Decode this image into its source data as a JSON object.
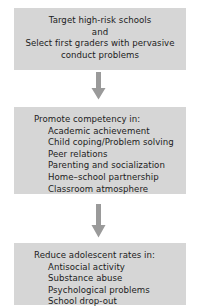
{
  "diagram": {
    "type": "flowchart",
    "orientation": "vertical",
    "colors": {
      "box_fill": "#d6d6d6",
      "text": "#1c1c1c",
      "arrow": "#9a9a9a",
      "background": "#ffffff"
    },
    "nodes": [
      {
        "id": "node-target",
        "align": "center",
        "lines": [
          "Target high-risk schools",
          "and",
          "Select first graders with pervasive",
          "conduct problems"
        ]
      },
      {
        "id": "node-promote",
        "align": "left",
        "heading": "Promote competency in:",
        "items": [
          "Academic achievement",
          "Child coping/Problem solving",
          "Peer relations",
          "Parenting and socialization",
          "Home–school partnership",
          "Classroom atmosphere"
        ]
      },
      {
        "id": "node-reduce",
        "align": "left",
        "heading": "Reduce adolescent rates in:",
        "items": [
          "Antisocial activity",
          "Substance abuse",
          "Psychological problems",
          "School drop-out"
        ]
      }
    ],
    "connectors": [
      {
        "id": "arrow-1",
        "from": "node-target",
        "to": "node-promote",
        "direction": "down"
      },
      {
        "id": "arrow-2",
        "from": "node-promote",
        "to": "node-reduce",
        "direction": "down"
      }
    ]
  }
}
